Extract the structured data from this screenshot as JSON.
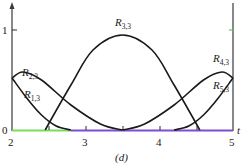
{
  "chart_data": {
    "type": "line",
    "title": "",
    "caption": "(d)",
    "xlabel": "t",
    "ylabel": "",
    "xlim": [
      2,
      5
    ],
    "ylim": [
      0,
      1
    ],
    "grid": false,
    "legend": "inline labels",
    "x_ticks": [
      2,
      2.5,
      3,
      3.5,
      4,
      4.5,
      5
    ],
    "x_tick_labels": [
      "2",
      "",
      "3",
      "",
      "4",
      "",
      "5"
    ],
    "y_ticks": [
      0,
      1
    ],
    "y_tick_labels": [
      "0",
      "1"
    ],
    "series": [
      {
        "name": "R1,3",
        "x": [
          2.0,
          2.2,
          2.4,
          2.6,
          2.8
        ],
        "values": [
          0.52,
          0.32,
          0.15,
          0.04,
          0.0
        ]
      },
      {
        "name": "R2,3",
        "x": [
          2.0,
          2.15,
          2.4,
          2.8,
          3.2,
          3.5
        ],
        "values": [
          0.52,
          0.58,
          0.5,
          0.25,
          0.06,
          0.0
        ]
      },
      {
        "name": "R3,3",
        "x": [
          2.45,
          2.8,
          3.1,
          3.5,
          3.9,
          4.2,
          4.55
        ],
        "values": [
          0.0,
          0.45,
          0.8,
          0.95,
          0.8,
          0.45,
          0.0
        ]
      },
      {
        "name": "R4,3",
        "x": [
          3.5,
          3.8,
          4.2,
          4.6,
          4.85,
          5.0
        ],
        "values": [
          0.0,
          0.06,
          0.25,
          0.5,
          0.58,
          0.52
        ]
      },
      {
        "name": "R5,3",
        "x": [
          4.2,
          4.4,
          4.6,
          4.8,
          5.0
        ],
        "values": [
          0.0,
          0.04,
          0.15,
          0.32,
          0.52
        ]
      }
    ],
    "baseline_segments": [
      {
        "from": 2.0,
        "to": 2.8,
        "color": "#7ddc5a"
      },
      {
        "from": 2.8,
        "to": 5.0,
        "color": "#7b4fd0"
      }
    ],
    "right_axis": {
      "x": 5,
      "tick_at_y": 1,
      "tick_color": "#6fbf6a"
    }
  },
  "labels": {
    "y_zero": "0",
    "y_one": "1",
    "x_2": "2",
    "x_3": "3",
    "x_4": "4",
    "x_5": "5",
    "t_axis": "t",
    "caption": "(d)",
    "r13": {
      "main": "R",
      "sub": "1,3"
    },
    "r23": {
      "main": "R",
      "sub": "2,3"
    },
    "r33": {
      "main": "R",
      "sub": "3,3"
    },
    "r43": {
      "main": "R",
      "sub": "4,3"
    },
    "r53": {
      "main": "R",
      "sub": "5,3"
    }
  },
  "colors": {
    "green_segment": "#7ddc5a",
    "purple_segment": "#7b4fd0",
    "axis": "#3a3a3a",
    "curve": "#1a1a1a"
  }
}
